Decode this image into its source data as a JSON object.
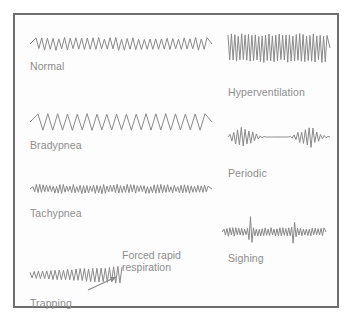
{
  "figure": {
    "border_color": "#6e6e6e",
    "trace_color": "#8a8a8a",
    "label_color": "#8d8d8d",
    "background_color": "#ffffff"
  },
  "annotation": {
    "text": "Forced rapid\nrespiration",
    "x": 122,
    "y": 249,
    "arrow": {
      "x1": 88,
      "y1": 290,
      "x2": 116,
      "y2": 277
    }
  },
  "chart_data": {
    "type": "line",
    "xlabel": "",
    "ylabel": "",
    "grid": false,
    "legend": "none",
    "series": [
      {
        "name": "Normal",
        "label": "Normal",
        "label_x": 30,
        "label_y": 60,
        "x0": 30,
        "x1": 212,
        "baseline": 44,
        "cycles": 30,
        "amplitude": 11,
        "lead_flat": 6,
        "tail_flat": 5,
        "jitter": 0.18,
        "envelope": "flat"
      },
      {
        "name": "Bradypnea",
        "label": "Bradypnea",
        "label_x": 30,
        "label_y": 139,
        "x0": 30,
        "x1": 212,
        "baseline": 122,
        "cycles": 17,
        "amplitude": 16,
        "lead_flat": 8,
        "tail_flat": 7,
        "jitter": 0.05,
        "envelope": "flat"
      },
      {
        "name": "Tachypnea",
        "label": "Tachypnea",
        "label_x": 30,
        "label_y": 207,
        "x0": 30,
        "x1": 212,
        "baseline": 189,
        "cycles": 52,
        "amplitude": 7,
        "lead_flat": 3,
        "tail_flat": 4,
        "jitter": 0.35,
        "envelope": "flat"
      },
      {
        "name": "Trapping",
        "label": "Trapping",
        "label_x": 30,
        "label_y": 297,
        "x0": 30,
        "x1": 122,
        "baseline": 275,
        "cycles": 22,
        "amplitude": 11,
        "lead_flat": 0,
        "tail_flat": 0,
        "jitter": 0.1,
        "envelope": "rising"
      },
      {
        "name": "Hyperventilation",
        "label": "Hyperventilation",
        "label_x": 228,
        "label_y": 86,
        "x0": 228,
        "x1": 330,
        "baseline": 48,
        "cycles": 29,
        "amplitude": 26,
        "lead_flat": 0,
        "tail_flat": 3,
        "jitter": 0.12,
        "envelope": "flat"
      },
      {
        "name": "Periodic",
        "label": "Periodic",
        "label_x": 228,
        "label_y": 167,
        "x0": 228,
        "x1": 330,
        "baseline": 137,
        "cycles": 26,
        "amplitude": 17,
        "lead_flat": 2,
        "tail_flat": 2,
        "jitter": 0.2,
        "envelope": "periodic-bursts"
      },
      {
        "name": "Sighing",
        "label": "Sighing",
        "label_x": 228,
        "label_y": 252,
        "x0": 222,
        "x1": 326,
        "baseline": 232,
        "cycles": 34,
        "amplitude": 7,
        "lead_flat": 2,
        "tail_flat": 2,
        "jitter": 0.25,
        "envelope": "sighs"
      }
    ]
  }
}
